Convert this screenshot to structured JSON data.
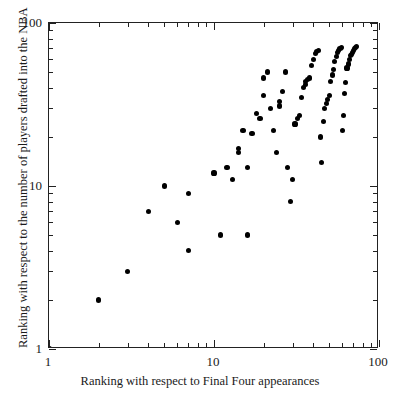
{
  "figure": {
    "background_color": "#ffffff",
    "marker_color": "#000000",
    "axis_color": "#222222"
  },
  "chart_data": {
    "type": "scatter",
    "title": "",
    "xlabel": "Ranking with respect to Final Four appearances",
    "ylabel": "Ranking with respect to the number of players drafted into the NBA",
    "xscale": "log",
    "yscale": "log",
    "xlim": [
      1,
      100
    ],
    "ylim": [
      1,
      100
    ],
    "xticks": [
      1,
      10,
      100
    ],
    "xtick_labels": [
      "1",
      "10",
      "100"
    ],
    "yticks": [
      1,
      10,
      100
    ],
    "ytick_labels": [
      "1",
      "10",
      "100"
    ],
    "grid": false,
    "legend": null,
    "marker": "filled-circle",
    "points": [
      [
        1,
        1
      ],
      [
        2,
        2
      ],
      [
        3,
        3
      ],
      [
        4,
        7
      ],
      [
        5,
        10
      ],
      [
        6,
        6
      ],
      [
        7,
        4
      ],
      [
        7,
        9
      ],
      [
        10,
        12
      ],
      [
        11,
        5
      ],
      [
        12,
        13
      ],
      [
        13,
        11
      ],
      [
        14,
        16
      ],
      [
        14,
        17
      ],
      [
        15,
        22
      ],
      [
        16,
        13
      ],
      [
        16,
        5
      ],
      [
        17,
        21
      ],
      [
        18,
        28
      ],
      [
        19,
        26
      ],
      [
        20,
        36
      ],
      [
        20,
        46
      ],
      [
        21,
        50
      ],
      [
        22,
        30
      ],
      [
        23,
        22
      ],
      [
        24,
        16
      ],
      [
        25,
        31
      ],
      [
        25,
        33
      ],
      [
        26,
        38
      ],
      [
        27,
        50
      ],
      [
        28,
        13
      ],
      [
        29,
        8
      ],
      [
        30,
        11
      ],
      [
        31,
        24
      ],
      [
        32,
        26
      ],
      [
        33,
        27
      ],
      [
        34,
        35
      ],
      [
        35,
        40
      ],
      [
        36,
        42
      ],
      [
        36,
        44
      ],
      [
        37,
        45
      ],
      [
        38,
        46
      ],
      [
        39,
        55
      ],
      [
        40,
        60
      ],
      [
        41,
        65
      ],
      [
        42,
        67
      ],
      [
        43,
        68
      ],
      [
        44,
        20
      ],
      [
        45,
        14
      ],
      [
        46,
        25
      ],
      [
        47,
        30
      ],
      [
        48,
        32
      ],
      [
        49,
        34
      ],
      [
        50,
        36
      ],
      [
        51,
        44
      ],
      [
        52,
        48
      ],
      [
        53,
        52
      ],
      [
        54,
        58
      ],
      [
        55,
        62
      ],
      [
        56,
        66
      ],
      [
        57,
        68
      ],
      [
        58,
        70
      ],
      [
        59,
        71
      ],
      [
        60,
        22
      ],
      [
        61,
        27
      ],
      [
        62,
        37
      ],
      [
        63,
        43
      ],
      [
        64,
        53
      ],
      [
        65,
        56
      ],
      [
        66,
        60
      ],
      [
        67,
        63
      ],
      [
        68,
        64
      ],
      [
        69,
        66
      ],
      [
        70,
        68
      ],
      [
        71,
        70
      ],
      [
        72,
        71
      ],
      [
        73,
        72
      ]
    ]
  },
  "axis": {
    "x_title": "Ranking with respect to Final Four appearances",
    "y_title": "Ranking with respect to the number of players drafted into the NBA",
    "x_tick_labels": [
      "1",
      "10",
      "100"
    ],
    "y_tick_labels": [
      "1",
      "10",
      "100"
    ]
  },
  "caption": {
    "partial_text": ""
  }
}
